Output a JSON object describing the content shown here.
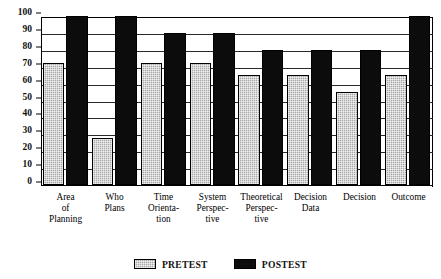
{
  "chart_data": {
    "type": "bar",
    "title": "",
    "xlabel": "",
    "ylabel": "",
    "ylim": [
      0,
      100
    ],
    "ytick_step": 10,
    "yticks": [
      "100",
      "90",
      "80",
      "70",
      "60",
      "50",
      "40",
      "30",
      "20",
      "10",
      "0"
    ],
    "grid": true,
    "legend_position": "bottom-center",
    "categories": [
      "Area of Planning",
      "Who Plans",
      "Time Orientation",
      "System Perspective",
      "Theoretical Perspective",
      "Decision Data",
      "Decision",
      "Outcome"
    ],
    "category_lines": [
      [
        "Area",
        "of",
        "Planning"
      ],
      [
        "Who",
        "Plans"
      ],
      [
        "Time",
        "Orienta-",
        "tion"
      ],
      [
        "System",
        "Perspec-",
        "tive"
      ],
      [
        "Theoretical",
        "Perspec-",
        "tive"
      ],
      [
        "Decision",
        "Data"
      ],
      [
        "Decision"
      ],
      [
        "Outcome"
      ]
    ],
    "series": [
      {
        "name": "PRETEST",
        "color": "#a8a8a8",
        "pattern": "checkered-gray",
        "values": [
          72,
          28,
          72,
          72,
          65,
          65,
          55,
          65
        ]
      },
      {
        "name": "POSTEST",
        "color": "#0c0c0c",
        "pattern": "solid-black",
        "values": [
          100,
          100,
          90,
          90,
          80,
          80,
          80,
          100
        ]
      }
    ]
  },
  "legend": {
    "items": [
      {
        "label": "PRETEST"
      },
      {
        "label": "POSTEST"
      }
    ]
  }
}
